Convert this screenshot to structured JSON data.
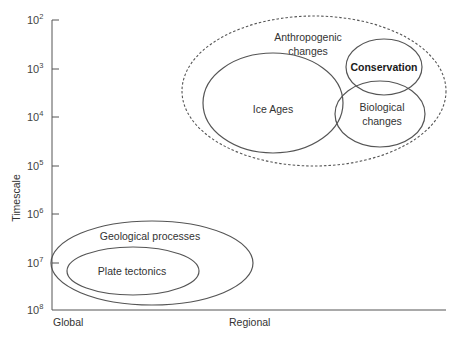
{
  "diagram": {
    "y_axis": {
      "label": "Timescale",
      "ticks": [
        {
          "base": "10",
          "exp": "2",
          "y": 20
        },
        {
          "base": "10",
          "exp": "3",
          "y": 69
        },
        {
          "base": "10",
          "exp": "4",
          "y": 117
        },
        {
          "base": "10",
          "exp": "5",
          "y": 166
        },
        {
          "base": "10",
          "exp": "6",
          "y": 214
        },
        {
          "base": "10",
          "exp": "7",
          "y": 263
        },
        {
          "base": "10",
          "exp": "8",
          "y": 310
        }
      ]
    },
    "x_axis": {
      "labels": {
        "left": "Global",
        "middle": "Regional"
      }
    },
    "groups": {
      "anthropogenic": {
        "line1": "Anthropogenic",
        "line2": "changes",
        "style": "dashed"
      },
      "ice_ages": {
        "label": "Ice Ages"
      },
      "conservation": {
        "label": "Conservation"
      },
      "biological": {
        "line1": "Biological",
        "line2": "changes"
      },
      "geological": {
        "label": "Geological processes"
      },
      "plate_tectonics": {
        "label": "Plate tectonics"
      }
    },
    "colors": {
      "line": "#555555",
      "text": "#333333"
    }
  }
}
